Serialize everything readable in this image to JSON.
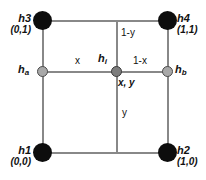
{
  "diagram": {
    "colors": {
      "corner_node": "#0d0d0d",
      "mid_node": "#a8a8a8",
      "center_node": "#7d7d7d",
      "edge_line": "#888888",
      "text": "#111111",
      "background": "#ffffff"
    },
    "corners": [
      {
        "id": "h3",
        "name": "h3",
        "coord": "(0,1)",
        "position": "top-left"
      },
      {
        "id": "h4",
        "name": "h4",
        "coord": "(1,1)",
        "position": "top-right"
      },
      {
        "id": "h1",
        "name": "h1",
        "coord": "(0,0)",
        "position": "bottom-left"
      },
      {
        "id": "h2",
        "name": "h2",
        "coord": "(1,0)",
        "position": "bottom-right"
      }
    ],
    "interior_nodes": [
      {
        "id": "ha",
        "base": "h",
        "subscript": "a",
        "position": "mid-left"
      },
      {
        "id": "hb",
        "base": "h",
        "subscript": "b",
        "position": "mid-right"
      },
      {
        "id": "hi",
        "base": "h",
        "subscript": "i",
        "position": "center",
        "coord": "x, y"
      }
    ],
    "edge_labels": [
      {
        "id": "x",
        "text": "x",
        "segment": "ha-to-hi"
      },
      {
        "id": "one-minus-x",
        "text": "1-x",
        "segment": "hi-to-hb"
      },
      {
        "id": "one-minus-y",
        "text": "1-y",
        "segment": "hi-to-top"
      },
      {
        "id": "y",
        "text": "y",
        "segment": "hi-to-bottom"
      }
    ]
  }
}
